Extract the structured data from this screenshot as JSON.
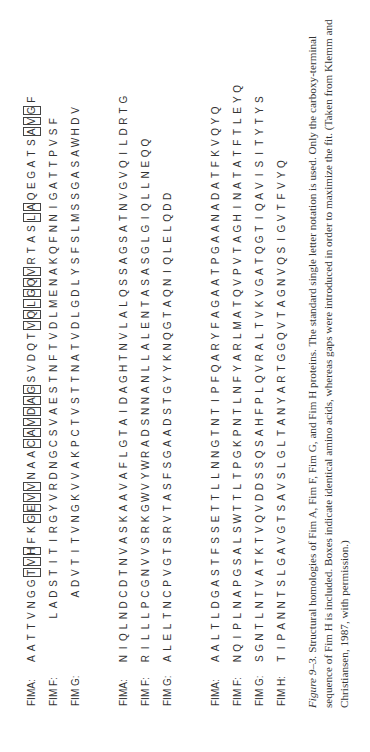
{
  "figure": {
    "blocks": [
      {
        "rows": [
          {
            "label": "FIMA:",
            "seq": "AATTVNGGTVHFKGEVVNAACAVDAGSVDQTVQLGQVRTASLAQEGATSAVGF",
            "boxes": [
              [
                8,
                10
              ],
              [
                13,
                16
              ],
              [
                20,
                21
              ],
              [
                22,
                25
              ],
              [
                31,
                36
              ],
              [
                41,
                42
              ],
              [
                49,
                51
              ]
            ]
          },
          {
            "label": "FIM F:",
            "seq": "    LADSTITIRGYVRDNGCSVAESTNFTVDLMENAKQFNNIGATTPVSF",
            "boxes": []
          },
          {
            "label": "FIM G:",
            "seq": "      ADVTITVNGKVVAKPCTVSTTNATVDLGDLYSFSLMSSGASAWHDV",
            "boxes": []
          }
        ]
      },
      {
        "rows": [
          {
            "label": "FIMA:",
            "seq": "NIQLNDCDTNVASKAAVAFLGTAIDAGHTNVLALQSSAGSATNVGVQILDRTG",
            "boxes": []
          },
          {
            "label": "FIM F:",
            "seq": "RILLLPCGNVVSRKGWVYWRADSNNANLLALENTASASGLGIQLLNEQQ",
            "boxes": []
          },
          {
            "label": "FIM G:",
            "seq": "ALELTNCPVGTSRVTASFSGAADSTGYYKNQGTAQNIQLELQDD",
            "boxes": []
          }
        ]
      },
      {
        "rows": [
          {
            "label": "FIMA:",
            "seq": "AALTLDGASTFSSETTLLNNGTNTIPFQARYFAGAATPGAANADATFKVQYQ",
            "boxes": []
          },
          {
            "label": "FIM F:",
            "seq": "NQIPLNAPGSALSWTTLTPGKPNTLNFYARLMATQVPVTAGHINATATFTLEYQ",
            "boxes": []
          },
          {
            "label": "FIM G:",
            "seq": "SGNTLNTVATKTVQVDDSSQSAHFPLQVRALTVKVGATQGTIQAVISITYTYS",
            "boxes": []
          },
          {
            "label": "FIM H:",
            "seq": "TIPANNTSLGAVGTSAVSLGLTANYARTGGQVTAGNVQSIGVTFVYQ",
            "boxes": []
          }
        ]
      }
    ],
    "caption": {
      "label": "Figure 9–3.",
      "text": "Structural homologies of Fim A, Fim F, Fim G, and Fim H proteins. The standard single letter notation is used. Only the carboxy-terminal sequence of Fim H is included. Boxes indicate identical amino acids, whereas gaps were introduced in order to maximize the fit. (Taken from Klemm and Christiansen, 1987, with permission.)"
    }
  }
}
